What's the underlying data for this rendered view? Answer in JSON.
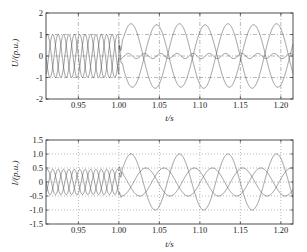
{
  "figure": {
    "background_color": "#ffffff",
    "frame_color": "#3a3a3a",
    "grid_color": "#8a8a8a",
    "trace_color": "#4a4a4a"
  },
  "chart_data": [
    {
      "type": "line",
      "panel_name": "voltage",
      "title": "",
      "xlabel": "t/s",
      "ylabel": "U/(p.u.)",
      "xlim": [
        0.91,
        1.215
      ],
      "ylim": [
        -2,
        2
      ],
      "xticks": [
        0.95,
        1.0,
        1.05,
        1.1,
        1.15,
        1.2
      ],
      "xticklabels": [
        "0.95",
        "1.00",
        "1.05",
        "1.10",
        "1.15",
        "1.20"
      ],
      "yticks": [
        -2,
        -1,
        0,
        1,
        2
      ],
      "yticklabels": [
        "-2",
        "-1",
        "0",
        "1",
        "2"
      ],
      "grid": true,
      "grid_style": "dash-dot",
      "legend": "none",
      "event_time": 1.0,
      "series": [
        {
          "name": "U_a",
          "description": "phase-a voltage: pre-event 50 Hz amplitude 1.0 p.u.; post-event 16.7 Hz amplitude 1.5 p.u.",
          "pre": {
            "amplitude": 1.0,
            "frequency_hz": 50,
            "phase_deg": 0
          },
          "post": {
            "amplitude": 1.5,
            "frequency_hz": 16.7,
            "phase_deg": 0
          }
        },
        {
          "name": "U_b",
          "description": "phase-b voltage: pre-event 50 Hz amplitude 1.0 p.u.; post-event collapses to 0.12 p.u. ripple",
          "pre": {
            "amplitude": 1.0,
            "frequency_hz": 50,
            "phase_deg": -120
          },
          "post": {
            "amplitude": 0.12,
            "frequency_hz": 50,
            "phase_deg": -120
          }
        },
        {
          "name": "U_c",
          "description": "phase-c voltage: pre-event 50 Hz amplitude 1.0 p.u.; post-event 16.7 Hz amplitude 1.45 p.u.",
          "pre": {
            "amplitude": 1.0,
            "frequency_hz": 50,
            "phase_deg": 120
          },
          "post": {
            "amplitude": 1.45,
            "frequency_hz": 16.7,
            "phase_deg": 170
          }
        }
      ]
    },
    {
      "type": "line",
      "panel_name": "current",
      "title": "",
      "xlabel": "t/s",
      "ylabel": "I/(p.u.)",
      "xlim": [
        0.91,
        1.215
      ],
      "ylim": [
        -1.5,
        1.5
      ],
      "xticks": [
        0.95,
        1.0,
        1.05,
        1.1,
        1.15,
        1.2
      ],
      "xticklabels": [
        "0.95",
        "1.00",
        "1.05",
        "1.10",
        "1.15",
        "1.20"
      ],
      "yticks": [
        -1.5,
        -1.0,
        -0.5,
        0,
        0.5,
        1.0,
        1.5
      ],
      "yticklabels": [
        "-1.5",
        "-1.0",
        "-0.5",
        "0",
        "0.5",
        "1.0",
        "1.5"
      ],
      "grid": true,
      "grid_style": "dotted",
      "legend": "none",
      "event_time": 1.0,
      "series": [
        {
          "name": "I_a",
          "description": "phase-a current: pre-event 50 Hz amplitude 0.45 p.u.; post-event 16.7 Hz amplitude 1.0 p.u.",
          "pre": {
            "amplitude": 0.45,
            "frequency_hz": 50,
            "phase_deg": 0
          },
          "post": {
            "amplitude": 1.0,
            "frequency_hz": 16.7,
            "phase_deg": 0
          }
        },
        {
          "name": "I_b",
          "description": "phase-b current: pre-event 50 Hz amplitude 0.45 p.u.; post-event 16.7 Hz amplitude 0.5 p.u.",
          "pre": {
            "amplitude": 0.45,
            "frequency_hz": 50,
            "phase_deg": -120
          },
          "post": {
            "amplitude": 0.5,
            "frequency_hz": 16.7,
            "phase_deg": -110
          }
        },
        {
          "name": "I_c",
          "description": "phase-c current: pre-event 50 Hz amplitude 0.45 p.u.; post-event 16.7 Hz amplitude 0.5 p.u.",
          "pre": {
            "amplitude": 0.45,
            "frequency_hz": 50,
            "phase_deg": 120
          },
          "post": {
            "amplitude": 0.5,
            "frequency_hz": 16.7,
            "phase_deg": 115
          }
        }
      ]
    }
  ]
}
